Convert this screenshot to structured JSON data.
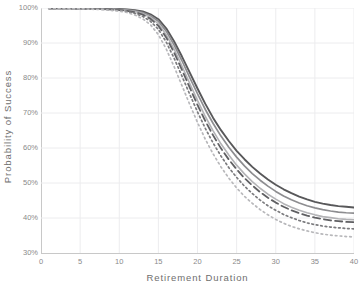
{
  "chart_data": {
    "type": "line",
    "title": "",
    "xlabel": "Retirement Duration",
    "ylabel": "Probability of Success",
    "xlim": [
      0,
      40
    ],
    "ylim": [
      30,
      100
    ],
    "grid": true,
    "legend_position": "none",
    "x_tick_labels": [
      "0",
      "5",
      "10",
      "15",
      "20",
      "25",
      "30",
      "35",
      "40"
    ],
    "x_tick_values": [
      0,
      5,
      10,
      15,
      20,
      25,
      30,
      35,
      40
    ],
    "y_tick_labels": [
      "30%",
      "40%",
      "50%",
      "60%",
      "70%",
      "80%",
      "90%",
      "100%"
    ],
    "y_tick_values": [
      30,
      40,
      50,
      60,
      70,
      80,
      90,
      100
    ],
    "y_unit": "%",
    "x": [
      1,
      2,
      3,
      4,
      5,
      6,
      7,
      8,
      9,
      10,
      11,
      12,
      13,
      14,
      15,
      16,
      17,
      18,
      19,
      20,
      21,
      22,
      23,
      24,
      25,
      26,
      27,
      28,
      29,
      30,
      31,
      32,
      33,
      34,
      35,
      36,
      37,
      38,
      39,
      40
    ],
    "series": [
      {
        "name": "series-1",
        "style": "solid",
        "color": "#58585a",
        "width": 1.9,
        "values": [
          99.9,
          99.9,
          99.9,
          99.9,
          99.9,
          99.9,
          99.8,
          99.8,
          99.8,
          99.7,
          99.6,
          99.4,
          99.0,
          98.2,
          96.8,
          94.2,
          90.5,
          86.2,
          81.6,
          77.0,
          72.6,
          68.6,
          65.1,
          62.0,
          59.2,
          56.8,
          54.6,
          52.7,
          51.0,
          49.5,
          48.2,
          47.1,
          46.1,
          45.3,
          44.6,
          44.1,
          43.7,
          43.4,
          43.2,
          43.0
        ]
      },
      {
        "name": "series-2",
        "style": "solid",
        "color": "#8d8d90",
        "width": 1.7,
        "values": [
          99.9,
          99.9,
          99.9,
          99.9,
          99.9,
          99.8,
          99.8,
          99.8,
          99.7,
          99.6,
          99.5,
          99.2,
          98.7,
          97.8,
          96.2,
          93.4,
          89.5,
          85.0,
          80.2,
          75.5,
          71.0,
          67.0,
          63.4,
          60.2,
          57.4,
          54.9,
          52.7,
          50.8,
          49.1,
          47.6,
          46.3,
          45.2,
          44.3,
          43.5,
          42.9,
          42.4,
          42.0,
          41.7,
          41.5,
          41.4
        ]
      },
      {
        "name": "series-3",
        "style": "solid-light",
        "color": "#b3b3b6",
        "width": 1.6,
        "values": [
          99.9,
          99.9,
          99.9,
          99.9,
          99.8,
          99.8,
          99.8,
          99.7,
          99.6,
          99.5,
          99.3,
          99.0,
          98.4,
          97.3,
          95.5,
          92.4,
          88.3,
          83.5,
          78.5,
          73.6,
          69.0,
          64.9,
          61.2,
          58.0,
          55.1,
          52.6,
          50.4,
          48.5,
          46.8,
          45.4,
          44.1,
          43.1,
          42.2,
          41.5,
          40.9,
          40.4,
          40.1,
          39.8,
          39.6,
          39.5
        ]
      },
      {
        "name": "series-4",
        "style": "dashed",
        "color": "#5f5f62",
        "width": 1.8,
        "values": [
          99.9,
          99.9,
          99.9,
          99.9,
          99.8,
          99.8,
          99.7,
          99.7,
          99.6,
          99.4,
          99.2,
          98.8,
          98.1,
          96.9,
          94.9,
          91.6,
          87.3,
          82.4,
          77.3,
          72.3,
          67.7,
          63.6,
          59.9,
          56.7,
          53.9,
          51.4,
          49.3,
          47.4,
          45.8,
          44.4,
          43.2,
          42.2,
          41.4,
          40.7,
          40.1,
          39.7,
          39.3,
          39.1,
          38.9,
          38.8
        ]
      },
      {
        "name": "series-5",
        "style": "dotted",
        "color": "#7b7b7e",
        "width": 1.7,
        "values": [
          99.9,
          99.9,
          99.9,
          99.8,
          99.8,
          99.8,
          99.7,
          99.6,
          99.5,
          99.3,
          99.0,
          98.5,
          97.6,
          96.2,
          93.9,
          90.3,
          85.7,
          80.6,
          75.4,
          70.3,
          65.6,
          61.4,
          57.7,
          54.4,
          51.6,
          49.1,
          47.0,
          45.1,
          43.5,
          42.2,
          41.0,
          40.1,
          39.3,
          38.6,
          38.1,
          37.7,
          37.4,
          37.2,
          37.0,
          36.9
        ]
      },
      {
        "name": "series-6",
        "style": "dotted-light",
        "color": "#b8b8bb",
        "width": 1.7,
        "values": [
          99.9,
          99.9,
          99.8,
          99.8,
          99.8,
          99.7,
          99.6,
          99.5,
          99.3,
          99.1,
          98.7,
          98.0,
          96.9,
          95.2,
          92.4,
          88.3,
          83.3,
          77.9,
          72.5,
          67.3,
          62.5,
          58.3,
          54.6,
          51.4,
          48.6,
          46.2,
          44.2,
          42.4,
          40.9,
          39.6,
          38.5,
          37.6,
          36.9,
          36.3,
          35.8,
          35.4,
          35.1,
          34.9,
          34.7,
          34.6
        ]
      }
    ],
    "colors": {
      "gridline": "#ececee",
      "axis": "#c8c8c8",
      "tick_text": "#8a8a8a",
      "axis_title": "#6e6e6e",
      "background": "#ffffff"
    }
  }
}
